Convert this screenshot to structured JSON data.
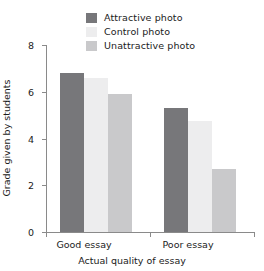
{
  "chart_data": {
    "type": "bar",
    "title": "",
    "subtitle": "",
    "categories": [
      "Good essay",
      "Poor essay"
    ],
    "series": [
      {
        "name": "Attractive photo",
        "values": [
          6.8,
          5.3
        ],
        "color": "#77777a"
      },
      {
        "name": "Control photo",
        "values": [
          6.6,
          4.75
        ],
        "color": "#ededee"
      },
      {
        "name": "Unattractive photo",
        "values": [
          5.9,
          2.7
        ],
        "color": "#c9c9cb"
      }
    ],
    "xlabel": "Actual quality of essay",
    "ylabel": "Grade given by students",
    "ylim": [
      0,
      8
    ],
    "yticks": [
      0,
      2,
      4,
      6,
      8
    ],
    "ytick_labels": [
      "0",
      "2",
      "4",
      "6",
      "8"
    ],
    "grid": false,
    "legend_position": "top-center"
  },
  "legend": {
    "items": [
      {
        "label": "Attractive photo"
      },
      {
        "label": "Control photo"
      },
      {
        "label": "Unattractive photo"
      }
    ]
  },
  "axes": {
    "y_title": "Grade given by students",
    "x_title": "Actual quality of essay",
    "y_tick_labels": [
      "0",
      "2",
      "4",
      "6",
      "8"
    ],
    "x_tick_labels": [
      "Good essay",
      "Poor essay"
    ]
  },
  "colors": {
    "attractive": "#77777a",
    "control": "#ededee",
    "unattractive": "#c9c9cb",
    "axis": "#8a8a8a",
    "text": "#1b1b1b",
    "background": "#ffffff"
  }
}
